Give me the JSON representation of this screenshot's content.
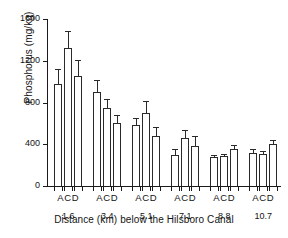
{
  "chart_data": {
    "type": "bar",
    "title": "",
    "xlabel": "Distance (km) below the Hilsboro Canal",
    "ylabel": "Phosphorus (mg/kg)",
    "ylim": [
      0,
      1600
    ],
    "yticks": [
      0,
      400,
      800,
      1200,
      1600
    ],
    "ytick_labels": [
      "0",
      "400",
      "800",
      "1200",
      "1600"
    ],
    "grid": false,
    "legend": "none",
    "group_tick_label": "ACD",
    "subcategories": [
      "A",
      "C",
      "D"
    ],
    "categories": [
      "1.6",
      "3.4",
      "5.1",
      "7.1",
      "8.8",
      "10.7"
    ],
    "series": [
      {
        "name": "A",
        "values": [
          980,
          900,
          580,
          300,
          275,
          320
        ],
        "errors": [
          140,
          120,
          75,
          55,
          25,
          35
        ]
      },
      {
        "name": "C",
        "values": [
          1320,
          750,
          700,
          460,
          285,
          310
        ],
        "errors": [
          165,
          80,
          115,
          75,
          25,
          30
        ]
      },
      {
        "name": "D",
        "values": [
          1050,
          600,
          480,
          385,
          355,
          405
        ],
        "errors": [
          155,
          85,
          90,
          95,
          40,
          35
        ]
      }
    ],
    "groups": [
      {
        "distance": "1.6",
        "bars": [
          {
            "label": "A",
            "value": 980,
            "error": 140
          },
          {
            "label": "C",
            "value": 1320,
            "error": 165
          },
          {
            "label": "D",
            "value": 1050,
            "error": 155
          }
        ]
      },
      {
        "distance": "3.4",
        "bars": [
          {
            "label": "A",
            "value": 900,
            "error": 120
          },
          {
            "label": "C",
            "value": 750,
            "error": 80
          },
          {
            "label": "D",
            "value": 600,
            "error": 85
          }
        ]
      },
      {
        "distance": "5.1",
        "bars": [
          {
            "label": "A",
            "value": 580,
            "error": 75
          },
          {
            "label": "C",
            "value": 700,
            "error": 115
          },
          {
            "label": "D",
            "value": 480,
            "error": 90
          }
        ]
      },
      {
        "distance": "7.1",
        "bars": [
          {
            "label": "A",
            "value": 300,
            "error": 55
          },
          {
            "label": "C",
            "value": 460,
            "error": 75
          },
          {
            "label": "D",
            "value": 385,
            "error": 95
          }
        ]
      },
      {
        "distance": "8.8",
        "bars": [
          {
            "label": "A",
            "value": 275,
            "error": 25
          },
          {
            "label": "C",
            "value": 285,
            "error": 25
          },
          {
            "label": "D",
            "value": 355,
            "error": 40
          }
        ]
      },
      {
        "distance": "10.7",
        "bars": [
          {
            "label": "A",
            "value": 320,
            "error": 35
          },
          {
            "label": "C",
            "value": 310,
            "error": 30
          },
          {
            "label": "D",
            "value": 405,
            "error": 35
          }
        ]
      }
    ],
    "colors": {
      "bar_fill": "#ffffff",
      "bar_stroke": "#2a2a2a",
      "axis": "#1a1a1a",
      "text": "#141414",
      "background": "#ffffff"
    }
  }
}
